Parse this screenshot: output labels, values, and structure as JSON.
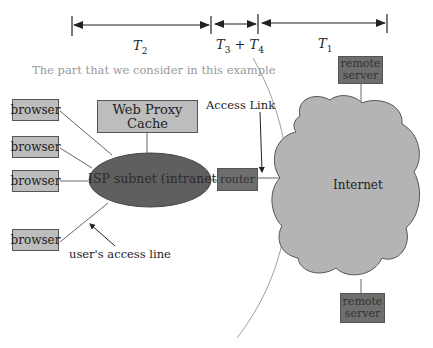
{
  "timeline": {
    "segments": [
      {
        "id": "t2",
        "label_var": "T",
        "label_sub": "2"
      },
      {
        "id": "t34",
        "label_var_a": "T",
        "label_sub_a": "3",
        "op": "+",
        "label_var_b": "T",
        "label_sub_b": "4"
      },
      {
        "id": "t1",
        "label_var": "T",
        "label_sub": "1"
      }
    ]
  },
  "region_caption": "The part that we consider in this example",
  "nodes": {
    "browsers": [
      "browser",
      "browser",
      "browser",
      "browser"
    ],
    "proxy": "Web Proxy Cache",
    "isp": "ISP subnet (intranet)",
    "router": "router",
    "internet": "Internet",
    "remote_top": [
      "remote",
      "server"
    ],
    "remote_bottom": [
      "remote",
      "server"
    ]
  },
  "annotations": {
    "access_link": "Access Link",
    "access_line": "user's access line"
  },
  "colors": {
    "light_box": "#bdbdbd",
    "dark_box": "#6e6e6e",
    "isp_fill": "#5f5f5f",
    "cloud_fill": "#b4b4b4",
    "line": "#555555"
  }
}
